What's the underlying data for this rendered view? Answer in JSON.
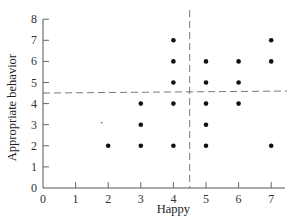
{
  "chart_data": {
    "type": "scatter",
    "title": "",
    "xlabel": "Happy",
    "ylabel": "Appropriate behavior",
    "xlim": [
      0,
      7.3
    ],
    "ylim": [
      0,
      8
    ],
    "x_ticks": [
      "0",
      "1",
      "2",
      "3",
      "4",
      "5",
      "6",
      "7"
    ],
    "y_ticks": [
      "0",
      "1",
      "2",
      "3",
      "4",
      "5",
      "6",
      "7",
      "8"
    ],
    "grid": false,
    "legend": "none",
    "reference_lines": {
      "vertical_x": 4.5,
      "horizontal_y": 4.5,
      "style": "dashed"
    },
    "points": [
      {
        "x": 2,
        "y": 2
      },
      {
        "x": 3,
        "y": 2
      },
      {
        "x": 3,
        "y": 3
      },
      {
        "x": 3,
        "y": 4
      },
      {
        "x": 4,
        "y": 2
      },
      {
        "x": 4,
        "y": 4
      },
      {
        "x": 4,
        "y": 5
      },
      {
        "x": 4,
        "y": 6
      },
      {
        "x": 4,
        "y": 7
      },
      {
        "x": 5,
        "y": 2
      },
      {
        "x": 5,
        "y": 3
      },
      {
        "x": 5,
        "y": 4
      },
      {
        "x": 5,
        "y": 5
      },
      {
        "x": 5,
        "y": 6
      },
      {
        "x": 6,
        "y": 4
      },
      {
        "x": 6,
        "y": 5
      },
      {
        "x": 6,
        "y": 6
      },
      {
        "x": 7,
        "y": 2
      },
      {
        "x": 7,
        "y": 6
      },
      {
        "x": 7,
        "y": 7
      }
    ],
    "minor_marks": [
      {
        "x": 1.8,
        "y": 3.1
      }
    ]
  }
}
